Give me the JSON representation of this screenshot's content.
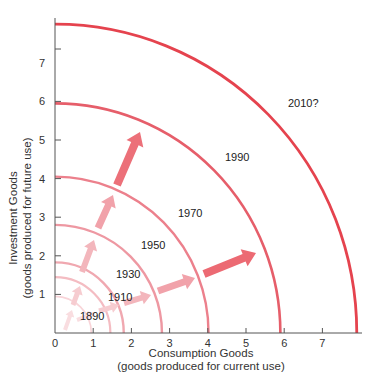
{
  "chart_data": {
    "type": "line",
    "title": "",
    "xlabel": "Consumption Goods",
    "xlabel_sub": "(goods produced for current use)",
    "ylabel": "Investment Goods",
    "ylabel_sub": "(goods produced for future use)",
    "xlim": [
      0,
      8
    ],
    "ylim": [
      0,
      8
    ],
    "x_ticks": [
      "0",
      "1",
      "2",
      "3",
      "4",
      "5",
      "6",
      "7"
    ],
    "y_ticks": [
      "1",
      "2",
      "3",
      "4",
      "5",
      "6",
      "7"
    ],
    "grid": false,
    "series": [
      {
        "name": "1890",
        "x_intercept": 0.95,
        "y_intercept": 0.95,
        "color": "#f8d4d8",
        "width": 1.6,
        "label_pos": [
          80,
          320
        ]
      },
      {
        "name": "1910",
        "x_intercept": 1.45,
        "y_intercept": 1.45,
        "color": "#f4bcc2",
        "width": 2.2,
        "label_pos": [
          108,
          301
        ]
      },
      {
        "name": "1930",
        "x_intercept": 1.8,
        "y_intercept": 1.83,
        "color": "#f0a8b0",
        "width": 2.4,
        "label_pos": [
          116,
          278
        ]
      },
      {
        "name": "1950",
        "x_intercept": 2.8,
        "y_intercept": 2.8,
        "color": "#ee98a2",
        "width": 2.4,
        "label_pos": [
          141,
          249
        ]
      },
      {
        "name": "1970",
        "x_intercept": 4.02,
        "y_intercept": 4.05,
        "color": "#ec808c",
        "width": 2.4,
        "label_pos": [
          178,
          217
        ]
      },
      {
        "name": "1990",
        "x_intercept": 5.9,
        "y_intercept": 5.95,
        "color": "#e65e6a",
        "width": 2.6,
        "label_pos": [
          225,
          161
        ]
      },
      {
        "name": "2010?",
        "x_intercept": 7.9,
        "y_intercept": 8.0,
        "color": "#e5434e",
        "width": 2.8,
        "label_pos": [
          288,
          107
        ]
      }
    ],
    "arrows": [
      {
        "from": [
          65,
          330
        ],
        "to": [
          72,
          310
        ],
        "color": "#f9dde0",
        "w": 4
      },
      {
        "from": [
          73,
          305
        ],
        "to": [
          80,
          286
        ],
        "color": "#f6ccd0",
        "w": 5
      },
      {
        "from": [
          82,
          272
        ],
        "to": [
          94,
          240
        ],
        "color": "#f3b6bc",
        "w": 6
      },
      {
        "from": [
          98,
          228
        ],
        "to": [
          113,
          195
        ],
        "color": "#f1a2aa",
        "w": 7
      },
      {
        "from": [
          117,
          185
        ],
        "to": [
          140,
          132
        ],
        "color": "#ec7079",
        "w": 8
      },
      {
        "from": [
          77,
          320
        ],
        "to": [
          95,
          313
        ],
        "color": "#f9dde0",
        "w": 4
      },
      {
        "from": [
          99,
          311
        ],
        "to": [
          119,
          305
        ],
        "color": "#f6ccd0",
        "w": 5
      },
      {
        "from": [
          124,
          303
        ],
        "to": [
          151,
          295
        ],
        "color": "#f3b6bc",
        "w": 6
      },
      {
        "from": [
          158,
          291
        ],
        "to": [
          195,
          278
        ],
        "color": "#f1a2aa",
        "w": 7
      },
      {
        "from": [
          204,
          274
        ],
        "to": [
          256,
          253
        ],
        "color": "#ec6a73",
        "w": 8
      }
    ]
  },
  "layout": {
    "origin_px": [
      55,
      333
    ],
    "unit_px_x": 38.2,
    "unit_px_y": 38.6,
    "extra_y_tick_px": 49
  }
}
